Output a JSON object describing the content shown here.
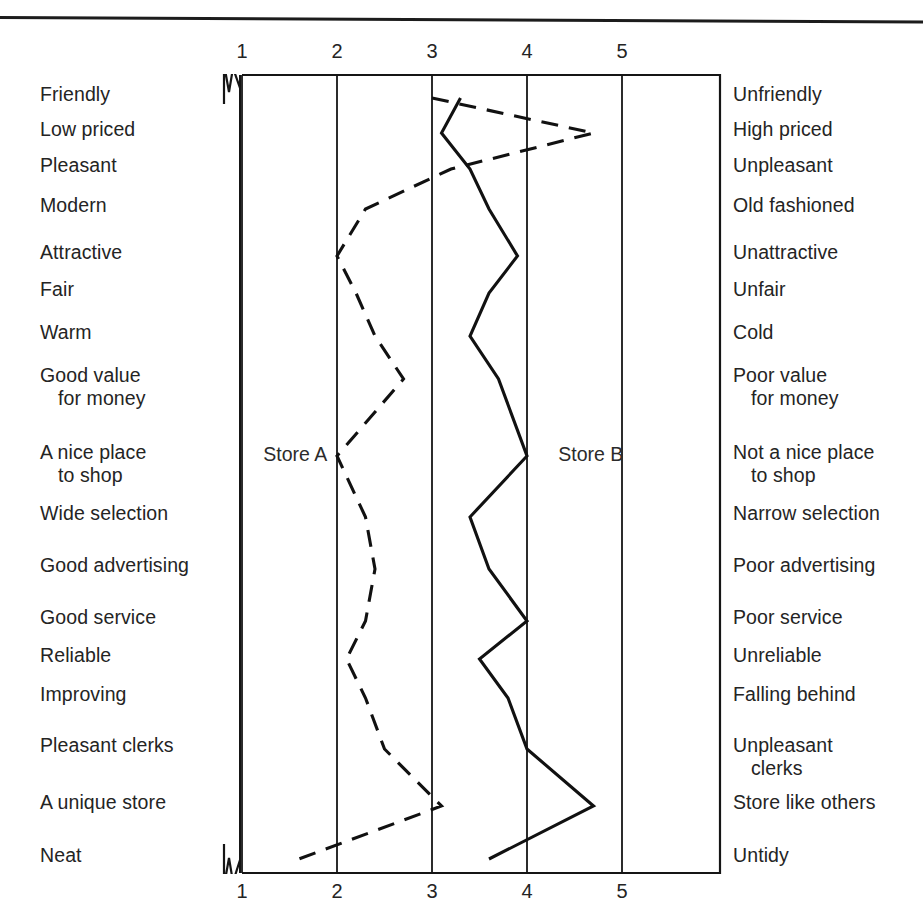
{
  "chart_data": {
    "type": "line",
    "title": "",
    "xlabel": "",
    "ylabel": "",
    "orientation": "horizontal-profile",
    "xlim": [
      1,
      5
    ],
    "xticks": [
      1,
      2,
      3,
      4,
      5
    ],
    "xtick_labels": [
      "1",
      "2",
      "3",
      "4",
      "5"
    ],
    "xticks_top": [
      "1",
      "2",
      "3",
      "4",
      "5"
    ],
    "xticks_bottom": [
      "1",
      "2",
      "3",
      "4",
      "5"
    ],
    "grid": true,
    "legend_position": "inline-annotation",
    "categories_left": [
      "Friendly",
      "Low priced",
      "Pleasant",
      "Modern",
      "Attractive",
      "Fair",
      "Warm",
      "Good value\nfor money",
      "A nice place\nto shop",
      "Wide selection",
      "Good advertising",
      "Good service",
      "Reliable",
      "Improving",
      "Pleasant clerks",
      "A unique store",
      "Neat"
    ],
    "categories_right": [
      "Unfriendly",
      "High priced",
      "Unpleasant",
      "Old fashioned",
      "Unattractive",
      "Unfair",
      "Cold",
      "Poor value\nfor money",
      "Not a nice place\nto shop",
      "Narrow selection",
      "Poor advertising",
      "Poor service",
      "Unreliable",
      "Falling behind",
      "Unpleasant\nclerks",
      "Store like others",
      "Untidy"
    ],
    "series": [
      {
        "name": "Store A",
        "style": "dashed",
        "color": "#111111",
        "values": [
          3.0,
          4.7,
          3.2,
          2.3,
          2.0,
          2.2,
          2.4,
          2.7,
          2.0,
          2.3,
          2.4,
          2.3,
          2.1,
          2.3,
          2.5,
          3.1,
          1.6
        ]
      },
      {
        "name": "Store B",
        "style": "solid",
        "color": "#111111",
        "values": [
          3.3,
          3.1,
          3.4,
          3.6,
          3.9,
          3.6,
          3.4,
          3.7,
          4.0,
          3.4,
          3.6,
          4.0,
          3.5,
          3.8,
          4.0,
          4.7,
          3.6
        ]
      }
    ],
    "annotations": [
      {
        "text": "Store A",
        "x": 2.15,
        "row_index": 8,
        "align": "right-of-point"
      },
      {
        "text": "Store B",
        "x": 4.35,
        "row_index": 8,
        "align": "left-of-point"
      }
    ]
  },
  "labels": {
    "store_a": "Store A",
    "store_b": "Store B"
  },
  "row_y": [
    98,
    133,
    169,
    209,
    256,
    293,
    336,
    379,
    456,
    517,
    569,
    621,
    659,
    698,
    749,
    806,
    859
  ]
}
